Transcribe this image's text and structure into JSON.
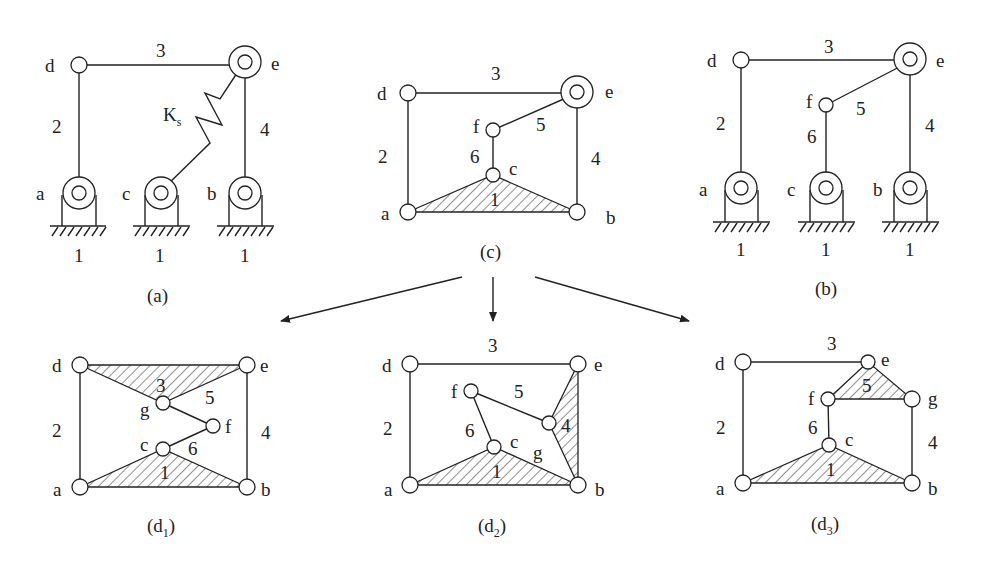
{
  "figure": {
    "panels": [
      {
        "id": "a",
        "caption": "(a)",
        "joints": [
          "d",
          "e",
          "a",
          "c",
          "b"
        ],
        "links": [
          "1",
          "2",
          "3",
          "4"
        ],
        "spring_label": "K",
        "spring_sub": "s",
        "ground_labels": [
          "1",
          "1",
          "1"
        ]
      },
      {
        "id": "c",
        "caption": "(c)",
        "joints": [
          "d",
          "e",
          "f",
          "c",
          "a",
          "b"
        ],
        "links": [
          "1",
          "2",
          "3",
          "4",
          "5",
          "6"
        ]
      },
      {
        "id": "b",
        "caption": "(b)",
        "joints": [
          "d",
          "e",
          "f",
          "a",
          "c",
          "b"
        ],
        "links": [
          "2",
          "3",
          "4",
          "5",
          "6"
        ],
        "ground_labels": [
          "1",
          "1",
          "1"
        ]
      },
      {
        "id": "d1",
        "caption": "(d",
        "caption_sub": "1",
        "caption_end": ")",
        "joints": [
          "d",
          "e",
          "g",
          "f",
          "c",
          "a",
          "b"
        ],
        "links": [
          "1",
          "2",
          "3",
          "4",
          "5",
          "6"
        ]
      },
      {
        "id": "d2",
        "caption": "(d",
        "caption_sub": "2",
        "caption_end": ")",
        "joints": [
          "d",
          "e",
          "f",
          "c",
          "g",
          "a",
          "b"
        ],
        "links": [
          "1",
          "2",
          "3",
          "4",
          "5",
          "6"
        ]
      },
      {
        "id": "d3",
        "caption": "(d",
        "caption_sub": "3",
        "caption_end": ")",
        "joints": [
          "d",
          "e",
          "f",
          "g",
          "c",
          "a",
          "b"
        ],
        "links": [
          "1",
          "2",
          "3",
          "4",
          "5",
          "6"
        ]
      }
    ],
    "arrows": [
      "c-to-d1",
      "c-to-d2",
      "c-to-d3"
    ]
  }
}
